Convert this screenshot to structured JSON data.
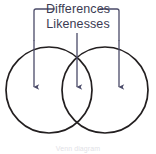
{
  "figure": {
    "type": "venn-diagram",
    "background_color": "#ffffff",
    "annotation_color": "#4a4a68",
    "circle_stroke_color": "#231f20",
    "text_color": "#3b3b52",
    "labels": {
      "differences": "Differences",
      "likenesses": "Likenesses",
      "caption": "Venn diagram"
    },
    "bracket": {
      "label_ref": "Differences",
      "left_x": 34,
      "right_x": 119,
      "top_y": 9,
      "side_drop_y": 40
    },
    "arrows": [
      {
        "name": "left-difference-arrow",
        "points_to": "Differences",
        "x": 34,
        "y_start": 40,
        "y_end": 93
      },
      {
        "name": "center-likeness-arrow",
        "points_to": "Likenesses",
        "x": 77,
        "y_start": 33,
        "y_end": 93
      },
      {
        "name": "right-difference-arrow",
        "points_to": "Differences",
        "x": 119,
        "y_start": 40,
        "y_end": 93
      }
    ],
    "circles": [
      {
        "name": "left-circle",
        "cx": 49,
        "cy": 90,
        "r": 43
      },
      {
        "name": "right-circle",
        "cx": 105,
        "cy": 90,
        "r": 43
      }
    ]
  }
}
